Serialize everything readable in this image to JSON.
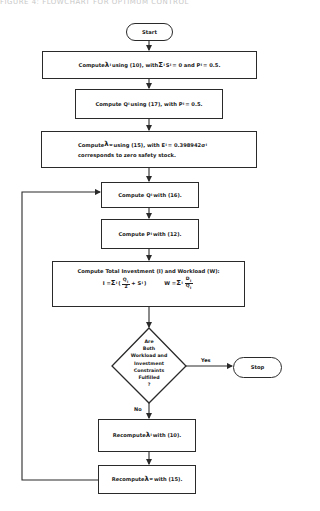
{
  "header_fragment": "FIGURE 4: FLOWCHART FOR OPTIMUM CONTROL",
  "flowchart": {
    "start": "Start",
    "stop": "Stop",
    "step1": {
      "prefix": "Compute ",
      "sym": "λ",
      "sub": "i",
      "mid": " using (10), with ",
      "sum": "Σ",
      "sum_sub": "i",
      "var": " S",
      "var_sub": "i",
      "rest": " = 0 and P",
      "p_sub": "i",
      "end": " = 0.5."
    },
    "step2": {
      "prefix": "Compute Q",
      "sub": "i",
      "rest": " using (17), with P",
      "p_sub": "i",
      "end": " = 0.5."
    },
    "step3": {
      "prefix": "Compute ",
      "sym": "λ",
      "sub": "w",
      "rest": " using (15), with E",
      "e_sub": "i",
      "end": " = 0.398942σ",
      "sigma_sub": "i",
      "line2": "corresponds to zero safety stock."
    },
    "step4": {
      "prefix": "Compute Q",
      "sub": "i",
      "rest": " with (16)."
    },
    "step5": {
      "prefix": "Compute P",
      "sub": "i",
      "rest": " with (12)."
    },
    "step6": {
      "title": "Compute Total Investment (I) and Workload (W):",
      "i_formula": {
        "lhs": "I = ",
        "sum": "Σ",
        "sum_sub": "i",
        "num": "Q",
        "num_sub": "i",
        "den": "2",
        "plus": " + S",
        "s_sub": "i",
        "open": "(",
        "close": ")"
      },
      "w_formula": {
        "lhs": "W = ",
        "sum": "Σ",
        "sum_sub": "i",
        "num": "D",
        "num_sub": "i",
        "den": "Q",
        "den_sub": "i"
      }
    },
    "decision": {
      "lines": [
        "Are",
        "Both",
        "Workload and",
        "Investment",
        "Constraints",
        "Fulfilled",
        "?"
      ]
    },
    "yes_label": "Yes",
    "no_label": "No",
    "step7": {
      "prefix": "Recompute ",
      "sym": "λ",
      "sub": "i",
      "rest": " with (10)."
    },
    "step8": {
      "prefix": "Recompute ",
      "sym": "λ",
      "sub": "w",
      "rest": " with (15)."
    }
  },
  "colors": {
    "line": "#2a2a2a",
    "background": "#ffffff"
  }
}
